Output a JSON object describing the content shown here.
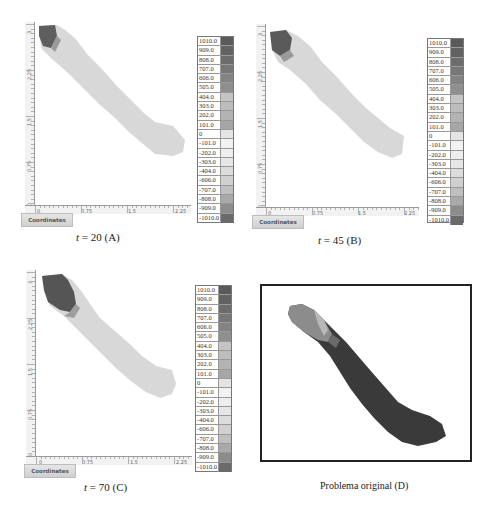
{
  "figure": {
    "panels": [
      {
        "id": "A",
        "caption_var": "t",
        "caption_rest": " = 20 (A)",
        "coordinates_button": "Coordinates",
        "y_ticks": [
          "0",
          "0.75",
          "1.5",
          "2.25",
          "3"
        ],
        "x_ticks": [
          "0",
          "0.75",
          "1.5",
          "2.25"
        ]
      },
      {
        "id": "B",
        "caption_var": "t",
        "caption_rest": " = 45 (B)",
        "coordinates_button": "Coordinates",
        "y_ticks": [
          "0",
          "0.75",
          "1.5",
          "2.25",
          "3"
        ],
        "x_ticks": [
          "0",
          "0.75",
          "1.5",
          "2.25"
        ]
      },
      {
        "id": "C",
        "caption_var": "t",
        "caption_rest": " = 70 (C)",
        "coordinates_button": "Coordinates",
        "y_ticks": [
          "0",
          "0.75",
          "1.5",
          "2.25",
          "3"
        ],
        "x_ticks": [
          "0",
          "0.75",
          "1.5",
          "2.25"
        ]
      },
      {
        "id": "D",
        "caption": "Problema original (D)"
      }
    ],
    "colorbar": {
      "labels": [
        "1010.0",
        "909.0",
        "808.0",
        "707.0",
        "606.0",
        "505.0",
        "404.0",
        "303.0",
        "202.0",
        "101.0",
        "0",
        "-101.0",
        "-202.0",
        "-303.0",
        "-404.0",
        "-606.0",
        "-707.0",
        "-808.0",
        "-909.0",
        "-1010.0"
      ],
      "colors": [
        "#5a5a5a",
        "#626262",
        "#6c6c6c",
        "#777777",
        "#838383",
        "#8f8f8f",
        "#c4c4c4",
        "#bdbdbd",
        "#b3b3b3",
        "#a6a6a6",
        "#e4e4e4",
        "#f2f2f2",
        "#eeeeee",
        "#e6e6e6",
        "#dcdcdc",
        "#d0d0d0",
        "#bfbfbf",
        "#a9a9a9",
        "#8c8c8c",
        "#6a6a6a"
      ]
    },
    "colors": {
      "domain_fill": "#d6d6d6",
      "source_dark": "#555555",
      "original_dark": "#3a3a3a",
      "original_light": "#8e8e8e"
    }
  }
}
